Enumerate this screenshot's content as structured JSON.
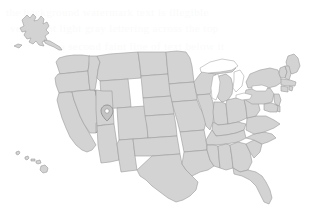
{
  "map": {
    "title": "United States choropleth map",
    "region_label": "United States of America",
    "projection": "albers-usa",
    "background_color": "#ffffff",
    "state_fill_color": "#d3d3d3",
    "state_border_color": "#9a9a9a",
    "lake_fill_color": "#ffffff",
    "marker_fill_color": "#c4c4c4",
    "marker_border_color": "#7e7e7e",
    "zoom_level": "1",
    "insets": [
      {
        "name": "alaska-inset",
        "label": "Alaska"
      },
      {
        "name": "hawaii-inset",
        "label": "Hawaii"
      }
    ],
    "markers": [
      {
        "name": "utah-marker",
        "label": "Utah",
        "x": 107,
        "y": 111
      }
    ],
    "lakes": [
      {
        "name": "lake-superior",
        "label": "Lake Superior"
      },
      {
        "name": "lake-michigan",
        "label": "Lake Michigan"
      },
      {
        "name": "lake-huron",
        "label": "Lake Huron"
      },
      {
        "name": "lake-erie",
        "label": "Lake Erie"
      },
      {
        "name": "lake-ontario",
        "label": "Lake Ontario"
      }
    ]
  },
  "watermark": {
    "lines": [
      "the background watermark text is illegible",
      "very faint light gray lettering across the top",
      "a second faint line of text below it"
    ]
  }
}
